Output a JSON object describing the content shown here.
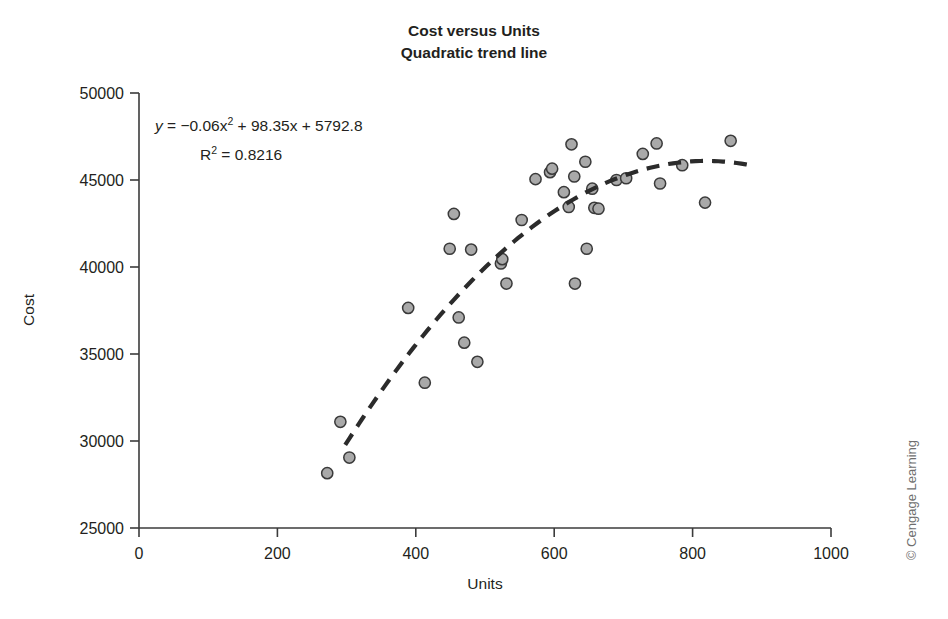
{
  "figure": {
    "credit": "© Cengage Learning"
  },
  "chart_data": {
    "type": "scatter",
    "title": "Cost versus Units",
    "subtitle": "Quadratic trend line",
    "xlabel": "Units",
    "ylabel": "Cost",
    "xlim": [
      0,
      1000
    ],
    "ylim": [
      25000,
      50000
    ],
    "xticks": [
      0,
      200,
      400,
      600,
      800,
      1000
    ],
    "xtick_labels": [
      "0",
      "200",
      "400",
      "600",
      "800",
      "1000"
    ],
    "yticks": [
      25000,
      30000,
      35000,
      40000,
      45000,
      50000
    ],
    "ytick_labels": [
      "25000",
      "30000",
      "35000",
      "40000",
      "45000",
      "50000"
    ],
    "grid": false,
    "legend": false,
    "marker_fill": "#a9a9a9",
    "marker_edge": "#3a3a3a",
    "trendline_color": "#2b2b2b",
    "annotation": {
      "equation_prefix": "y",
      "equation_body": " = −0.06x",
      "equation_exp": "2",
      "equation_tail": " + 98.35x + 5792.8",
      "equation_full": "y = −0.06x² + 98.35x + 5792.8",
      "r_squared_label": "R",
      "r_squared_exp": "2",
      "r_squared_value": " = 0.8216",
      "r_squared_full": "R² = 0.8216"
    },
    "trendline": {
      "kind": "quadratic",
      "a": -0.06,
      "b": 98.35,
      "c": 5792.8,
      "x_start": 298,
      "x_end": 890
    },
    "points": [
      {
        "x": 272,
        "y": 28150
      },
      {
        "x": 291,
        "y": 31100
      },
      {
        "x": 304,
        "y": 29050
      },
      {
        "x": 389,
        "y": 37650
      },
      {
        "x": 413,
        "y": 33350
      },
      {
        "x": 449,
        "y": 41050
      },
      {
        "x": 455,
        "y": 43050
      },
      {
        "x": 462,
        "y": 37100
      },
      {
        "x": 470,
        "y": 35650
      },
      {
        "x": 480,
        "y": 41000
      },
      {
        "x": 489,
        "y": 34550
      },
      {
        "x": 523,
        "y": 40200
      },
      {
        "x": 525,
        "y": 40450
      },
      {
        "x": 531,
        "y": 39050
      },
      {
        "x": 553,
        "y": 42700
      },
      {
        "x": 573,
        "y": 45050
      },
      {
        "x": 594,
        "y": 45450
      },
      {
        "x": 597,
        "y": 45650
      },
      {
        "x": 614,
        "y": 44300
      },
      {
        "x": 621,
        "y": 43450
      },
      {
        "x": 625,
        "y": 47050
      },
      {
        "x": 629,
        "y": 45200
      },
      {
        "x": 630,
        "y": 39050
      },
      {
        "x": 645,
        "y": 46050
      },
      {
        "x": 647,
        "y": 41050
      },
      {
        "x": 655,
        "y": 44500
      },
      {
        "x": 658,
        "y": 43400
      },
      {
        "x": 664,
        "y": 43350
      },
      {
        "x": 690,
        "y": 45000
      },
      {
        "x": 704,
        "y": 45100
      },
      {
        "x": 728,
        "y": 46500
      },
      {
        "x": 748,
        "y": 47100
      },
      {
        "x": 753,
        "y": 44800
      },
      {
        "x": 785,
        "y": 45850
      },
      {
        "x": 818,
        "y": 43700
      },
      {
        "x": 855,
        "y": 47250
      }
    ]
  }
}
